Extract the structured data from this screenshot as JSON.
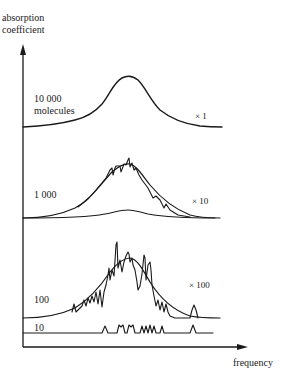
{
  "axes": {
    "y_label_line1": "absorption",
    "y_label_line2": "coefficient",
    "x_label": "frequency"
  },
  "panels": [
    {
      "count_line1": "10 000",
      "count_line2": "molecules",
      "scale": "× 1"
    },
    {
      "count_line1": "1 000",
      "scale": "× 10"
    },
    {
      "count_line1": "100",
      "scale": "× 100"
    },
    {
      "count_line1": "10"
    }
  ],
  "colors": {
    "ink": "#1a1a1a",
    "background": "#ffffff"
  }
}
